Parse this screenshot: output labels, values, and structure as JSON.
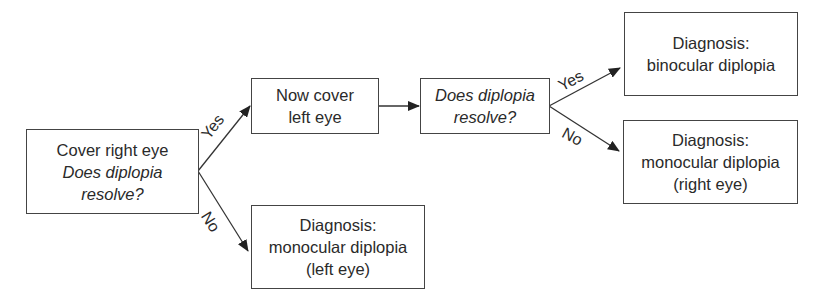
{
  "diagram": {
    "type": "flowchart",
    "nodes": {
      "start": {
        "line1": "Cover right eye",
        "line2": "Does diplopia",
        "line3": "resolve?"
      },
      "cover_left": {
        "line1": "Now cover",
        "line2": "left eye"
      },
      "question2": {
        "line1": "Does diplopia",
        "line2": "resolve?"
      },
      "binocular": {
        "line1": "Diagnosis:",
        "line2": "binocular diplopia"
      },
      "monocular_right": {
        "line1": "Diagnosis:",
        "line2": "monocular diplopia",
        "line3": "(right eye)"
      },
      "monocular_left": {
        "line1": "Diagnosis:",
        "line2": "monocular diplopia",
        "line3": "(left eye)"
      }
    },
    "edges": [
      {
        "from": "start",
        "to": "cover_left",
        "label": "Yes"
      },
      {
        "from": "start",
        "to": "monocular_left",
        "label": "No"
      },
      {
        "from": "cover_left",
        "to": "question2",
        "label": ""
      },
      {
        "from": "question2",
        "to": "binocular",
        "label": "Yes"
      },
      {
        "from": "question2",
        "to": "monocular_right",
        "label": "No"
      }
    ],
    "colors": {
      "line": "#333333",
      "text": "#2a2a2a",
      "background": "#ffffff"
    }
  }
}
